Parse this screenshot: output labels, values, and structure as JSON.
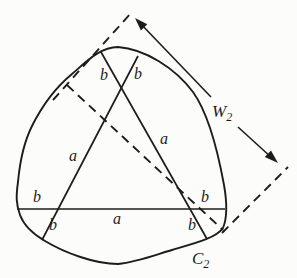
{
  "diagram": {
    "type": "geometry-figure",
    "background_color": "#fcfcfb",
    "ink_color": "#1c1c1c",
    "labels": {
      "width": {
        "main": "W",
        "sub": "2"
      },
      "curve": {
        "main": "C",
        "sub": "2"
      },
      "segments": {
        "top_left_b": "b",
        "top_right_b": "b",
        "left_chord_a": "a",
        "right_chord_a": "a",
        "horizontal_left_b": "b",
        "horizontal_middle_a": "a",
        "horizontal_right_b": "b",
        "bottom_left_b": "b",
        "bottom_right_b": "b"
      }
    }
  }
}
